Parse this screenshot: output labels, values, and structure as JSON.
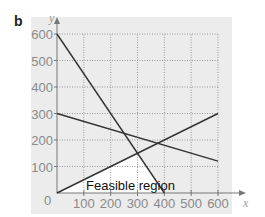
{
  "panel_label": "b",
  "chart_data": {
    "type": "line",
    "title": "",
    "xlabel": "x",
    "ylabel": "y",
    "xlim": [
      0,
      600
    ],
    "ylim": [
      0,
      600
    ],
    "grid": true,
    "x_ticks": [
      100,
      200,
      300,
      400,
      500,
      600
    ],
    "y_ticks": [
      100,
      200,
      300,
      400,
      500,
      600
    ],
    "origin_label": "0",
    "series": [
      {
        "name": "line-1",
        "points": [
          [
            0,
            600
          ],
          [
            400,
            0
          ]
        ]
      },
      {
        "name": "line-2",
        "points": [
          [
            0,
            300
          ],
          [
            600,
            120
          ]
        ]
      },
      {
        "name": "line-3",
        "points": [
          [
            0,
            0
          ],
          [
            600,
            300
          ]
        ]
      }
    ],
    "feasible_region": {
      "label": "Feasible region",
      "vertices": [
        [
          0,
          0
        ],
        [
          400,
          0
        ],
        [
          300,
          150
        ]
      ]
    }
  },
  "colors": {
    "background_panel": "#ececec",
    "grid": "#9a9a9a",
    "lines": "#333333",
    "feasible_fill": "#ffffff"
  }
}
